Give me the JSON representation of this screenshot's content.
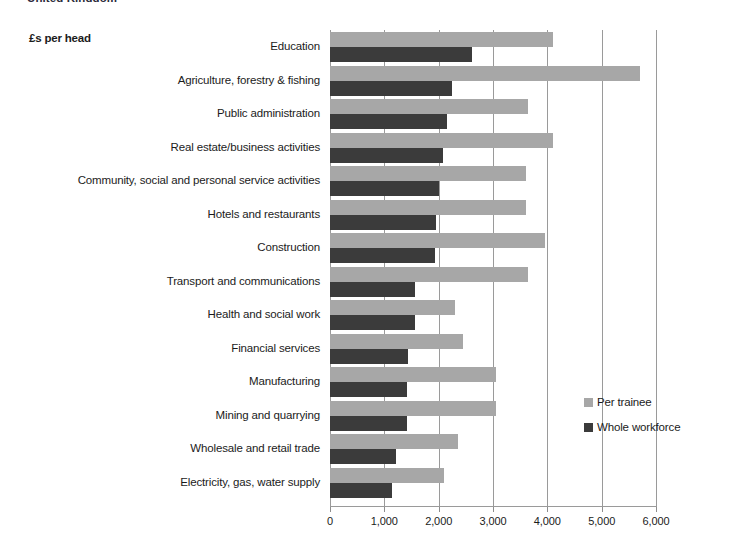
{
  "header": {
    "clipped_title": "United Kingdom"
  },
  "units_label": "£s per head",
  "legend": {
    "items": [
      {
        "label": "Per trainee",
        "color": "#a7a7a7",
        "name": "legend-per-trainee"
      },
      {
        "label": "Whole workforce",
        "color": "#3b3b3b",
        "name": "legend-whole-workforce"
      }
    ]
  },
  "chart_data": {
    "type": "bar",
    "orientation": "horizontal",
    "title": "United Kingdom",
    "xlabel": "£s per head",
    "ylabel": "",
    "xlim": [
      0,
      6000
    ],
    "xticks": [
      0,
      1000,
      2000,
      3000,
      4000,
      5000,
      6000
    ],
    "xtick_labels": [
      "0",
      "1,000",
      "2,000",
      "3,000",
      "4,000",
      "5,000",
      "6,000"
    ],
    "grid": true,
    "legend_position": "center-right",
    "categories": [
      "Education",
      "Agriculture, forestry & fishing",
      "Public administration",
      "Real estate/business activities",
      "Community, social and personal service activities",
      "Hotels and restaurants",
      "Construction",
      "Transport and communications",
      "Health and social work",
      "Financial services",
      "Manufacturing",
      "Mining and quarrying",
      "Wholesale and retail trade",
      "Electricity, gas, water supply"
    ],
    "series": [
      {
        "name": "Per trainee",
        "color": "#a7a7a7",
        "values": [
          4100,
          5700,
          3650,
          4100,
          3600,
          3600,
          3950,
          3650,
          2300,
          2450,
          3050,
          3050,
          2350,
          2100
        ]
      },
      {
        "name": "Whole workforce",
        "color": "#3b3b3b",
        "values": [
          2620,
          2250,
          2160,
          2080,
          2000,
          1960,
          1930,
          1560,
          1560,
          1440,
          1410,
          1420,
          1210,
          1150
        ]
      }
    ]
  }
}
